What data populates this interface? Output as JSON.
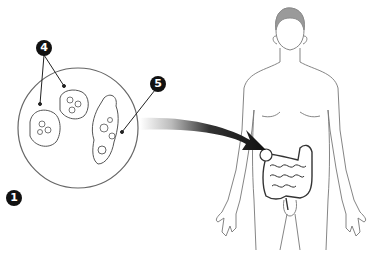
{
  "diagram": {
    "markers": [
      {
        "id": "1",
        "label": "1",
        "x": 6,
        "y": 190
      },
      {
        "id": "4",
        "label": "4",
        "x": 36,
        "y": 40
      },
      {
        "id": "5",
        "label": "5",
        "x": 150,
        "y": 76
      }
    ],
    "magnified_view": {
      "shape": "circle",
      "contains": [
        "cyst",
        "cyst",
        "trophozoite"
      ]
    },
    "pointer_arrow": {
      "from": "magnified-view",
      "to": "cecum"
    },
    "figure": {
      "type": "human-body-outline",
      "highlight": "large-intestine",
      "hair_color": "#9a9a9a"
    },
    "colors": {
      "line": "#555555",
      "marker_fill": "#111111",
      "arrow_dark": "#111111",
      "arrow_light": "#dddddd"
    }
  }
}
